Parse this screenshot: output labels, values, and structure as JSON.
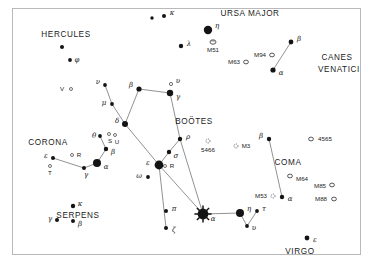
{
  "chart_data": {
    "type": "scatter",
    "xlabel": "",
    "ylabel": "",
    "grid": false,
    "legend": false,
    "xlim": [
      0,
      374
    ],
    "ylim": [
      0,
      267
    ],
    "background_color": "#ffffff",
    "ink_color": "#141414",
    "frame_color": "#b9b9b9",
    "constellation_names": [
      {
        "label": "HERCULES",
        "x": 66,
        "y": 35,
        "size": 8.2
      },
      {
        "label": "URSA MAJOR",
        "x": 250,
        "y": 14,
        "size": 8.2
      },
      {
        "label": "CANES",
        "x": 337,
        "y": 58,
        "size": 8.2
      },
      {
        "label": "VENATICI",
        "x": 339,
        "y": 70,
        "size": 8.2
      },
      {
        "label": "BOÖTES",
        "x": 194,
        "y": 122,
        "size": 8.2
      },
      {
        "label": "CORONA",
        "x": 48,
        "y": 143,
        "size": 8.2
      },
      {
        "label": "SERPENS",
        "x": 78,
        "y": 216,
        "size": 8.2
      },
      {
        "label": "COMA",
        "x": 288,
        "y": 163,
        "size": 8.2
      },
      {
        "label": "VIRGO",
        "x": 300,
        "y": 252,
        "size": 8.2
      }
    ],
    "stars": [
      {
        "id": "uma-kappa",
        "x": 164,
        "y": 16,
        "mag_px": 2.0,
        "label": "κ",
        "lx": 172,
        "ly": 13,
        "type": "dot"
      },
      {
        "id": "uma-anon1",
        "x": 152,
        "y": 18,
        "mag_px": 1.7,
        "label": "",
        "lx": 0,
        "ly": 0,
        "type": "dot"
      },
      {
        "id": "uma-eta",
        "x": 208,
        "y": 30,
        "mag_px": 4.2,
        "label": "η",
        "lx": 217,
        "ly": 26,
        "type": "dot"
      },
      {
        "id": "uma-lambda",
        "x": 181,
        "y": 46,
        "mag_px": 2.2,
        "label": "λ",
        "lx": 189,
        "ly": 44,
        "type": "dot"
      },
      {
        "id": "cvn-beta",
        "x": 291,
        "y": 42,
        "mag_px": 2.4,
        "label": "β",
        "lx": 299,
        "ly": 39,
        "type": "dot"
      },
      {
        "id": "cvn-alpha",
        "x": 273,
        "y": 70,
        "mag_px": 2.6,
        "label": "α",
        "lx": 281,
        "ly": 73,
        "type": "dot"
      },
      {
        "id": "her-anon",
        "x": 62,
        "y": 47,
        "mag_px": 2.0,
        "label": "",
        "lx": 0,
        "ly": 0,
        "type": "dot"
      },
      {
        "id": "her-phi",
        "x": 70,
        "y": 60,
        "mag_px": 1.9,
        "label": "φ",
        "lx": 77,
        "ly": 60,
        "type": "dot"
      },
      {
        "id": "boo-nu",
        "x": 105,
        "y": 85,
        "mag_px": 1.9,
        "label": "ν",
        "lx": 98,
        "ly": 82,
        "type": "dot"
      },
      {
        "id": "boo-mu",
        "x": 112,
        "y": 104,
        "mag_px": 1.9,
        "label": "μ",
        "lx": 104,
        "ly": 103,
        "type": "dot"
      },
      {
        "id": "boo-beta",
        "x": 139,
        "y": 89,
        "mag_px": 2.6,
        "label": "β",
        "lx": 131,
        "ly": 85,
        "type": "dot"
      },
      {
        "id": "boo-gamma",
        "x": 170,
        "y": 93,
        "mag_px": 3.2,
        "label": "γ",
        "lx": 178,
        "ly": 97,
        "type": "dot"
      },
      {
        "id": "boo-delta",
        "x": 125,
        "y": 124,
        "mag_px": 3.0,
        "label": "δ",
        "lx": 117,
        "ly": 121,
        "type": "dot"
      },
      {
        "id": "boo-rho",
        "x": 180,
        "y": 139,
        "mag_px": 2.2,
        "label": "ρ",
        "lx": 188,
        "ly": 137,
        "type": "dot"
      },
      {
        "id": "boo-sigma",
        "x": 169,
        "y": 152,
        "mag_px": 2.2,
        "label": "σ",
        "lx": 176,
        "ly": 156,
        "type": "dot"
      },
      {
        "id": "boo-epsilon",
        "x": 159,
        "y": 165,
        "mag_px": 4.4,
        "label": "ε",
        "lx": 148,
        "ly": 163,
        "type": "dot"
      },
      {
        "id": "boo-omega",
        "x": 148,
        "y": 177,
        "mag_px": 1.9,
        "label": "ω",
        "lx": 139,
        "ly": 176,
        "type": "dot"
      },
      {
        "id": "boo-pi",
        "x": 166,
        "y": 211,
        "mag_px": 2.0,
        "label": "π",
        "lx": 174,
        "ly": 209,
        "type": "dot"
      },
      {
        "id": "boo-zeta",
        "x": 166,
        "y": 228,
        "mag_px": 2.0,
        "label": "ζ",
        "lx": 174,
        "ly": 230,
        "type": "dot"
      },
      {
        "id": "boo-arcturus",
        "x": 203,
        "y": 214,
        "mag_px": 5.4,
        "label": "α",
        "lx": 213,
        "ly": 219,
        "type": "burst"
      },
      {
        "id": "boo-eta",
        "x": 240,
        "y": 213,
        "mag_px": 4.0,
        "label": "η",
        "lx": 249,
        "ly": 209,
        "type": "dot"
      },
      {
        "id": "boo-tau",
        "x": 257,
        "y": 211,
        "mag_px": 1.9,
        "label": "τ",
        "lx": 264,
        "ly": 209,
        "type": "dot"
      },
      {
        "id": "boo-upsilon",
        "x": 247,
        "y": 226,
        "mag_px": 1.9,
        "label": "υ",
        "lx": 254,
        "ly": 228,
        "type": "dot"
      },
      {
        "id": "boo-upsilon-top",
        "x": 171,
        "y": 84,
        "mag_px": 0,
        "label": "υ",
        "lx": 178,
        "ly": 81,
        "type": "open"
      },
      {
        "id": "crb-alpha",
        "x": 97,
        "y": 163,
        "mag_px": 4.0,
        "label": "α",
        "lx": 106,
        "ly": 167,
        "type": "dot"
      },
      {
        "id": "crb-beta",
        "x": 106,
        "y": 149,
        "mag_px": 2.2,
        "label": "β",
        "lx": 113,
        "ly": 152,
        "type": "dot"
      },
      {
        "id": "crb-theta",
        "x": 100,
        "y": 136,
        "mag_px": 1.9,
        "label": "θ",
        "lx": 94,
        "ly": 136,
        "type": "dot"
      },
      {
        "id": "crb-gamma",
        "x": 84,
        "y": 168,
        "mag_px": 2.0,
        "label": "γ",
        "lx": 86,
        "ly": 175,
        "type": "dot"
      },
      {
        "id": "crb-epsilon",
        "x": 53,
        "y": 158,
        "mag_px": 2.0,
        "label": "ε",
        "lx": 46,
        "ly": 156,
        "type": "dot"
      },
      {
        "id": "ser-kappa",
        "x": 73,
        "y": 206,
        "mag_px": 2.2,
        "label": "κ",
        "lx": 80,
        "ly": 204,
        "type": "dot"
      },
      {
        "id": "ser-gamma",
        "x": 57,
        "y": 220,
        "mag_px": 2.0,
        "label": "γ",
        "lx": 50,
        "ly": 219,
        "type": "dot"
      },
      {
        "id": "ser-beta",
        "x": 73,
        "y": 221,
        "mag_px": 2.0,
        "label": "β",
        "lx": 80,
        "ly": 224,
        "type": "dot"
      },
      {
        "id": "coma-beta",
        "x": 269,
        "y": 139,
        "mag_px": 2.2,
        "label": "β",
        "lx": 261,
        "ly": 136,
        "type": "dot"
      },
      {
        "id": "coma-alpha",
        "x": 282,
        "y": 197,
        "mag_px": 2.2,
        "label": "α",
        "lx": 290,
        "ly": 199,
        "type": "dot"
      },
      {
        "id": "vir-epsilon",
        "x": 307,
        "y": 238,
        "mag_px": 2.4,
        "label": "ε",
        "lx": 315,
        "ly": 240,
        "type": "dot"
      }
    ],
    "variable_stars": [
      {
        "id": "her-V",
        "x": 71,
        "y": 89,
        "label": "V",
        "lx": 62,
        "ly": 89
      },
      {
        "id": "crb-R",
        "x": 72,
        "y": 155,
        "label": "R",
        "lx": 79,
        "ly": 155
      },
      {
        "id": "crb-T",
        "x": 50,
        "y": 166,
        "label": "T",
        "lx": 50,
        "ly": 173
      },
      {
        "id": "crb-S",
        "x": 109,
        "y": 134,
        "label": "S",
        "lx": 110,
        "ly": 141
      },
      {
        "id": "crb-U",
        "x": 115,
        "y": 135,
        "label": "U",
        "lx": 117,
        "ly": 142
      },
      {
        "id": "boo-R",
        "x": 165,
        "y": 166,
        "label": "R",
        "lx": 172,
        "ly": 166
      }
    ],
    "deep_sky_objects": [
      {
        "id": "m51",
        "x": 213,
        "y": 42,
        "label": "M51",
        "lx": 213,
        "ly": 50,
        "shape": "spiral"
      },
      {
        "id": "m63",
        "x": 246,
        "y": 62,
        "label": "M63",
        "lx": 234,
        "ly": 62,
        "shape": "oval"
      },
      {
        "id": "m94",
        "x": 272,
        "y": 55,
        "label": "M94",
        "lx": 260,
        "ly": 55,
        "shape": "oval"
      },
      {
        "id": "ngc5466",
        "x": 208,
        "y": 141,
        "label": "5466",
        "lx": 208,
        "ly": 150,
        "shape": "cluster"
      },
      {
        "id": "m3",
        "x": 236,
        "y": 146,
        "label": "M3",
        "lx": 246,
        "ly": 146,
        "shape": "cluster"
      },
      {
        "id": "ngc4565",
        "x": 311,
        "y": 139,
        "label": "4565",
        "lx": 325,
        "ly": 139,
        "shape": "oval"
      },
      {
        "id": "m64",
        "x": 290,
        "y": 176,
        "label": "M64",
        "lx": 302,
        "ly": 179,
        "shape": "oval"
      },
      {
        "id": "m85",
        "x": 332,
        "y": 185,
        "label": "M85",
        "lx": 320,
        "ly": 186,
        "shape": "oval"
      },
      {
        "id": "m88",
        "x": 334,
        "y": 199,
        "label": "M88",
        "lx": 321,
        "ly": 199,
        "shape": "oval"
      },
      {
        "id": "m53",
        "x": 273,
        "y": 196,
        "label": "M53",
        "lx": 261,
        "ly": 196,
        "shape": "cluster"
      }
    ],
    "constellation_lines": [
      {
        "from": "boo-nu",
        "to": "boo-mu"
      },
      {
        "from": "boo-mu",
        "to": "boo-delta"
      },
      {
        "from": "boo-delta",
        "to": "boo-beta"
      },
      {
        "from": "boo-beta",
        "to": "boo-gamma"
      },
      {
        "from": "boo-gamma",
        "to": "boo-rho"
      },
      {
        "from": "boo-rho",
        "to": "boo-sigma"
      },
      {
        "from": "boo-sigma",
        "to": "boo-epsilon"
      },
      {
        "from": "boo-delta",
        "to": "boo-epsilon"
      },
      {
        "from": "boo-epsilon",
        "to": "boo-zeta"
      },
      {
        "from": "boo-epsilon",
        "to": "boo-arcturus"
      },
      {
        "from": "boo-rho",
        "to": "boo-arcturus"
      },
      {
        "from": "boo-arcturus",
        "to": "boo-eta"
      },
      {
        "from": "boo-eta",
        "to": "boo-upsilon"
      },
      {
        "from": "boo-upsilon",
        "to": "boo-tau"
      },
      {
        "from": "crb-alpha",
        "to": "crb-beta"
      },
      {
        "from": "crb-beta",
        "to": "crb-theta"
      },
      {
        "from": "crb-alpha",
        "to": "crb-gamma"
      },
      {
        "from": "crb-gamma",
        "to": "crb-epsilon"
      },
      {
        "from": "cvn-alpha",
        "to": "cvn-beta"
      },
      {
        "from": "coma-beta",
        "to": "coma-alpha"
      }
    ]
  }
}
